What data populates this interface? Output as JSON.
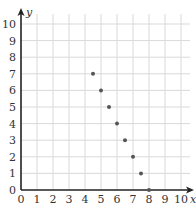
{
  "chart_data": {
    "type": "scatter",
    "title": "",
    "xlabel": "x",
    "ylabel": "y",
    "xlim": [
      0,
      10
    ],
    "ylim": [
      0,
      10
    ],
    "grid": true,
    "x_ticks": [
      "0",
      "1",
      "2",
      "3",
      "4",
      "5",
      "6",
      "7",
      "8",
      "9",
      "10"
    ],
    "y_ticks": [
      "0",
      "1",
      "2",
      "3",
      "4",
      "5",
      "6",
      "7",
      "8",
      "9",
      "10"
    ],
    "points": [
      {
        "x": 4.5,
        "y": 7
      },
      {
        "x": 5,
        "y": 6
      },
      {
        "x": 5.5,
        "y": 5
      },
      {
        "x": 6,
        "y": 4
      },
      {
        "x": 6.5,
        "y": 3
      },
      {
        "x": 7,
        "y": 2
      },
      {
        "x": 7.5,
        "y": 1
      },
      {
        "x": 8,
        "y": 0
      }
    ],
    "colors": {
      "grid": "#d9d9d9",
      "axis": "#222222",
      "point": "#555555"
    }
  }
}
